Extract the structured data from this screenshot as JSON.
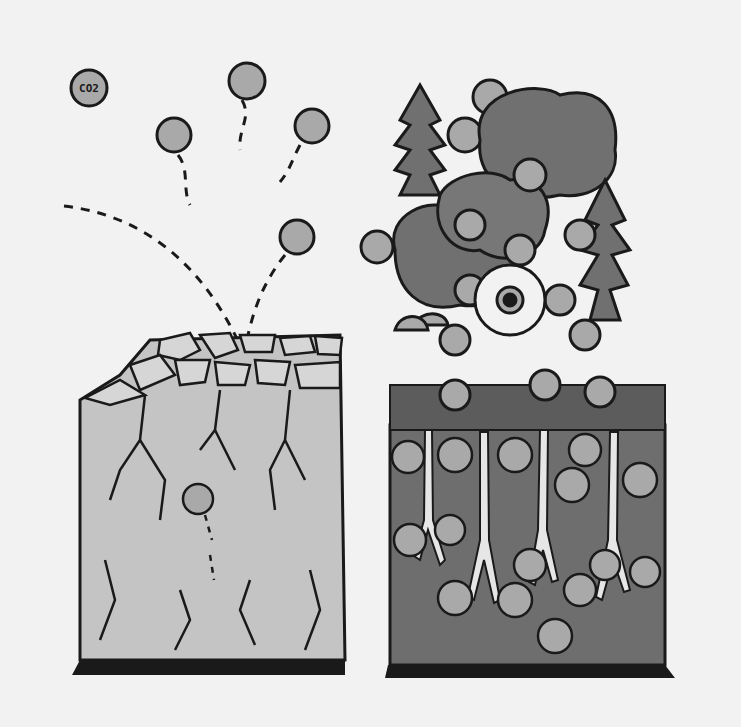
{
  "illustration": {
    "title": "Soil carbon comparison: degraded soil vs. healthy soil with vegetation",
    "co2_label": "CO2",
    "left_panel": {
      "description": "cracked, dry degraded soil block releasing CO2 molecules"
    },
    "right_panel": {
      "description": "vegetated soil block with trees, flowers, mushrooms and roots storing carbon"
    },
    "colors": {
      "background": "#f2f2f2",
      "molecule_fill": "#a9a9a9",
      "degraded_soil": "#c4c4c4",
      "healthy_soil": "#6e6e6e",
      "foliage": "#707070",
      "outline": "#1a1a1a",
      "root": "#e6e6e6"
    }
  }
}
